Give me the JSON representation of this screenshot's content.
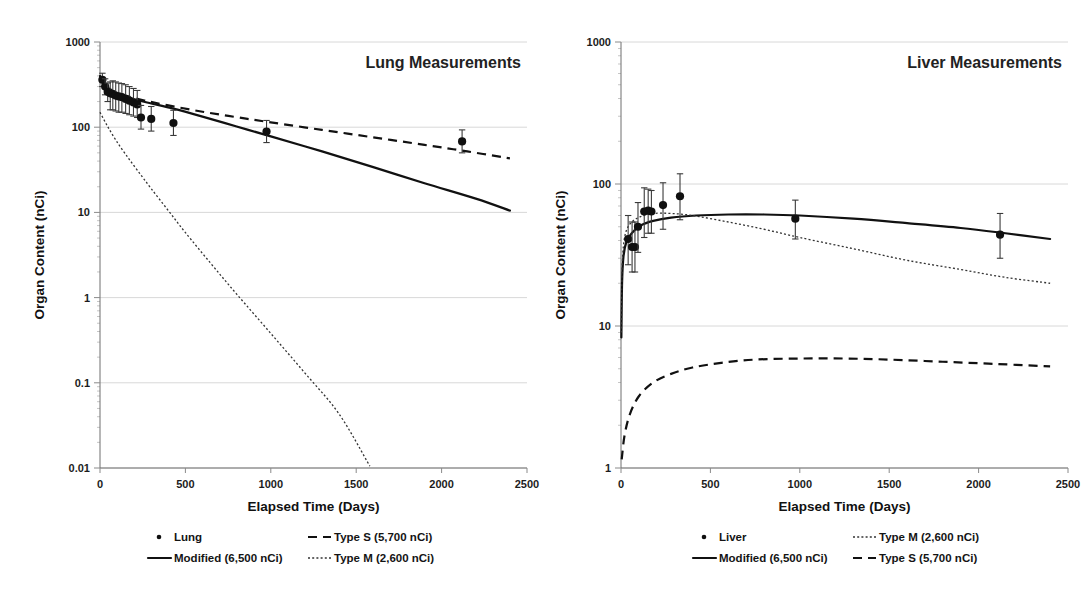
{
  "figure": {
    "background": "#ffffff",
    "accent": "#111111"
  },
  "chart_data": [
    {
      "id": "lung",
      "type": "line",
      "title": "Lung Measurements",
      "xlabel": "Elapsed Time (Days)",
      "ylabel": "Organ Content (nCi)",
      "xlim": [
        0,
        2500
      ],
      "ylim": [
        0.01,
        1000
      ],
      "yscale": "log",
      "xscale": "linear",
      "grid": true,
      "legend_position": "below",
      "xticks": [
        0,
        500,
        1000,
        1500,
        2000,
        2500
      ],
      "xtick_labels": [
        "0",
        "500",
        "1000",
        "1500",
        "2000",
        "2500"
      ],
      "yticks": [
        0.01,
        0.1,
        1,
        10,
        100,
        1000
      ],
      "ytick_labels": [
        "0.01",
        "0.1",
        "1",
        "10",
        "100",
        "1000"
      ],
      "scatter": {
        "name": "Lung",
        "marker": "filled-circle",
        "points": [
          {
            "x": 14,
            "y": 360,
            "yerr_low": 300,
            "yerr_high": 430
          },
          {
            "x": 30,
            "y": 300,
            "yerr_low": 240,
            "yerr_high": 370
          },
          {
            "x": 45,
            "y": 260,
            "yerr_low": 200,
            "yerr_high": 330
          },
          {
            "x": 60,
            "y": 250,
            "yerr_low": 160,
            "yerr_high": 340
          },
          {
            "x": 75,
            "y": 245,
            "yerr_low": 160,
            "yerr_high": 350
          },
          {
            "x": 92,
            "y": 235,
            "yerr_low": 155,
            "yerr_high": 340
          },
          {
            "x": 110,
            "y": 230,
            "yerr_low": 150,
            "yerr_high": 330
          },
          {
            "x": 128,
            "y": 225,
            "yerr_low": 150,
            "yerr_high": 325
          },
          {
            "x": 150,
            "y": 215,
            "yerr_low": 145,
            "yerr_high": 315
          },
          {
            "x": 172,
            "y": 205,
            "yerr_low": 140,
            "yerr_high": 300
          },
          {
            "x": 196,
            "y": 195,
            "yerr_low": 135,
            "yerr_high": 285
          },
          {
            "x": 218,
            "y": 185,
            "yerr_low": 130,
            "yerr_high": 270
          },
          {
            "x": 240,
            "y": 130,
            "yerr_low": 95,
            "yerr_high": 180
          },
          {
            "x": 300,
            "y": 125,
            "yerr_low": 90,
            "yerr_high": 175
          },
          {
            "x": 430,
            "y": 112,
            "yerr_low": 80,
            "yerr_high": 158
          },
          {
            "x": 975,
            "y": 89,
            "yerr_low": 66,
            "yerr_high": 120
          },
          {
            "x": 2120,
            "y": 68,
            "yerr_low": 50,
            "yerr_high": 93
          }
        ]
      },
      "series": [
        {
          "name": "Modified (6,500 nCi)",
          "style": "solid",
          "points": [
            {
              "x": 0,
              "y": 400
            },
            {
              "x": 30,
              "y": 300
            },
            {
              "x": 60,
              "y": 268
            },
            {
              "x": 120,
              "y": 240
            },
            {
              "x": 200,
              "y": 213
            },
            {
              "x": 300,
              "y": 190
            },
            {
              "x": 430,
              "y": 165
            },
            {
              "x": 600,
              "y": 133
            },
            {
              "x": 800,
              "y": 102
            },
            {
              "x": 1000,
              "y": 78
            },
            {
              "x": 1300,
              "y": 52
            },
            {
              "x": 1600,
              "y": 34
            },
            {
              "x": 1900,
              "y": 22
            },
            {
              "x": 2200,
              "y": 14.5
            },
            {
              "x": 2400,
              "y": 10.5
            }
          ]
        },
        {
          "name": "Type S  (5,700 nCi)",
          "style": "dashed",
          "points": [
            {
              "x": 0,
              "y": 400
            },
            {
              "x": 40,
              "y": 300
            },
            {
              "x": 90,
              "y": 258
            },
            {
              "x": 160,
              "y": 232
            },
            {
              "x": 260,
              "y": 206
            },
            {
              "x": 400,
              "y": 180
            },
            {
              "x": 600,
              "y": 152
            },
            {
              "x": 800,
              "y": 131
            },
            {
              "x": 1000,
              "y": 114
            },
            {
              "x": 1300,
              "y": 93
            },
            {
              "x": 1600,
              "y": 76
            },
            {
              "x": 1900,
              "y": 62
            },
            {
              "x": 2150,
              "y": 52
            },
            {
              "x": 2400,
              "y": 43
            }
          ]
        },
        {
          "name": "Type M  (2,600 nCi)",
          "style": "dotted",
          "points": [
            {
              "x": 0,
              "y": 150
            },
            {
              "x": 40,
              "y": 106
            },
            {
              "x": 90,
              "y": 72
            },
            {
              "x": 150,
              "y": 48
            },
            {
              "x": 220,
              "y": 31
            },
            {
              "x": 300,
              "y": 19
            },
            {
              "x": 400,
              "y": 10.5
            },
            {
              "x": 500,
              "y": 5.8
            },
            {
              "x": 650,
              "y": 2.5
            },
            {
              "x": 800,
              "y": 1.1
            },
            {
              "x": 1000,
              "y": 0.38
            },
            {
              "x": 1200,
              "y": 0.13
            },
            {
              "x": 1400,
              "y": 0.043
            },
            {
              "x": 1580,
              "y": 0.0105
            }
          ]
        }
      ],
      "legend": [
        {
          "label": "Lung",
          "marker": "dot"
        },
        {
          "label": "Type S   (5,700 nCi)",
          "marker": "dashed"
        },
        {
          "label": "Modified (6,500 nCi)",
          "marker": "solid"
        },
        {
          "label": "Type M  (2,600 nCi)",
          "marker": "dotted"
        }
      ]
    },
    {
      "id": "liver",
      "type": "line",
      "title": "Liver Measurements",
      "xlabel": "Elapsed Time (Days)",
      "ylabel": "Organ Content (nCi)",
      "xlim": [
        0,
        2500
      ],
      "ylim": [
        1,
        1000
      ],
      "yscale": "log",
      "xscale": "linear",
      "grid": true,
      "legend_position": "below",
      "xticks": [
        0,
        500,
        1000,
        1500,
        2000,
        2500
      ],
      "xtick_labels": [
        "0",
        "500",
        "1000",
        "1500",
        "2000",
        "2500"
      ],
      "yticks": [
        1,
        10,
        100,
        1000
      ],
      "ytick_labels": [
        "1",
        "10",
        "100",
        "1000"
      ],
      "scatter": {
        "name": "Liver",
        "marker": "filled-circle",
        "points": [
          {
            "x": 40,
            "y": 41,
            "yerr_low": 27,
            "yerr_high": 60
          },
          {
            "x": 62,
            "y": 36,
            "yerr_low": 24,
            "yerr_high": 54
          },
          {
            "x": 78,
            "y": 36,
            "yerr_low": 24,
            "yerr_high": 54
          },
          {
            "x": 95,
            "y": 50,
            "yerr_low": 33,
            "yerr_high": 74
          },
          {
            "x": 130,
            "y": 64,
            "yerr_low": 42,
            "yerr_high": 94
          },
          {
            "x": 152,
            "y": 65,
            "yerr_low": 45,
            "yerr_high": 92
          },
          {
            "x": 170,
            "y": 64,
            "yerr_low": 45,
            "yerr_high": 90
          },
          {
            "x": 235,
            "y": 71,
            "yerr_low": 48,
            "yerr_high": 102
          },
          {
            "x": 330,
            "y": 82,
            "yerr_low": 56,
            "yerr_high": 118
          },
          {
            "x": 975,
            "y": 57,
            "yerr_low": 41,
            "yerr_high": 77
          },
          {
            "x": 2120,
            "y": 44,
            "yerr_low": 30,
            "yerr_high": 62
          }
        ]
      },
      "series": [
        {
          "name": "Modified (6,500 nCi)",
          "style": "solid",
          "points": [
            {
              "x": 2,
              "y": 8.3
            },
            {
              "x": 6,
              "y": 20
            },
            {
              "x": 14,
              "y": 31
            },
            {
              "x": 30,
              "y": 39
            },
            {
              "x": 60,
              "y": 45
            },
            {
              "x": 110,
              "y": 51
            },
            {
              "x": 180,
              "y": 55
            },
            {
              "x": 280,
              "y": 58
            },
            {
              "x": 420,
              "y": 60
            },
            {
              "x": 600,
              "y": 61
            },
            {
              "x": 800,
              "y": 61
            },
            {
              "x": 1000,
              "y": 60
            },
            {
              "x": 1300,
              "y": 57
            },
            {
              "x": 1600,
              "y": 53
            },
            {
              "x": 1900,
              "y": 49
            },
            {
              "x": 2150,
              "y": 45
            },
            {
              "x": 2400,
              "y": 41
            }
          ]
        },
        {
          "name": "Type M  (2,600 nCi)",
          "style": "dotted",
          "points": [
            {
              "x": 2,
              "y": 9
            },
            {
              "x": 6,
              "y": 24
            },
            {
              "x": 14,
              "y": 37
            },
            {
              "x": 30,
              "y": 47
            },
            {
              "x": 60,
              "y": 54
            },
            {
              "x": 110,
              "y": 59
            },
            {
              "x": 180,
              "y": 62
            },
            {
              "x": 280,
              "y": 62
            },
            {
              "x": 400,
              "y": 60
            },
            {
              "x": 600,
              "y": 54
            },
            {
              "x": 800,
              "y": 48
            },
            {
              "x": 1000,
              "y": 42
            },
            {
              "x": 1300,
              "y": 35
            },
            {
              "x": 1600,
              "y": 29
            },
            {
              "x": 1900,
              "y": 25
            },
            {
              "x": 2150,
              "y": 22
            },
            {
              "x": 2400,
              "y": 20
            }
          ]
        },
        {
          "name": "Type S  (5,700 nCi)",
          "style": "dashed",
          "points": [
            {
              "x": 4,
              "y": 1.15
            },
            {
              "x": 20,
              "y": 1.7
            },
            {
              "x": 50,
              "y": 2.4
            },
            {
              "x": 100,
              "y": 3.2
            },
            {
              "x": 180,
              "y": 4.0
            },
            {
              "x": 280,
              "y": 4.6
            },
            {
              "x": 400,
              "y": 5.1
            },
            {
              "x": 560,
              "y": 5.5
            },
            {
              "x": 750,
              "y": 5.8
            },
            {
              "x": 1000,
              "y": 5.9
            },
            {
              "x": 1250,
              "y": 5.9
            },
            {
              "x": 1500,
              "y": 5.8
            },
            {
              "x": 1800,
              "y": 5.6
            },
            {
              "x": 2100,
              "y": 5.4
            },
            {
              "x": 2400,
              "y": 5.2
            }
          ]
        }
      ],
      "legend": [
        {
          "label": "Liver",
          "marker": "dot"
        },
        {
          "label": "Type M   (2,600 nCi)",
          "marker": "dotted"
        },
        {
          "label": "Modified (6,500 nCi)",
          "marker": "solid"
        },
        {
          "label": "Type S    (5,700 nCi)",
          "marker": "dashed"
        }
      ]
    }
  ]
}
